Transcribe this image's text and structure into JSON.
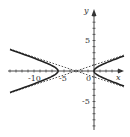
{
  "chart_data": {
    "type": "line",
    "title": "",
    "xlabel": "x",
    "ylabel": "y",
    "xlim": [
      -15,
      7
    ],
    "ylim": [
      -10,
      10
    ],
    "grid": false,
    "equation": "(x+3)^2/9 - y^2 = 1",
    "x_tick_labels": [
      "-10",
      "-5",
      "0"
    ],
    "y_tick_labels": [
      "5",
      "-5"
    ],
    "series": [
      {
        "name": "hyperbola-left-branch",
        "style": "solid",
        "points": [
          [
            -14,
            3.53
          ],
          [
            -10,
            2.07
          ],
          [
            -8,
            1.37
          ],
          [
            -7,
            0.88
          ],
          [
            -6,
            0
          ],
          [
            -7,
            -0.88
          ],
          [
            -8,
            -1.37
          ],
          [
            -10,
            -2.07
          ],
          [
            -14,
            -3.53
          ]
        ]
      },
      {
        "name": "hyperbola-right-branch",
        "style": "solid",
        "points": [
          [
            5,
            2.43
          ],
          [
            3,
            1.73
          ],
          [
            1,
            1.0
          ],
          [
            0.5,
            0.6
          ],
          [
            0,
            0
          ],
          [
            0.5,
            -0.6
          ],
          [
            1,
            -1.0
          ],
          [
            3,
            -1.73
          ],
          [
            5,
            -2.43
          ]
        ]
      },
      {
        "name": "asymptote-1",
        "style": "dashed",
        "points": [
          [
            -14,
            3.67
          ],
          [
            5,
            -2.67
          ]
        ]
      },
      {
        "name": "asymptote-2",
        "style": "dashed",
        "points": [
          [
            -14,
            -3.67
          ],
          [
            5,
            2.67
          ]
        ]
      }
    ]
  },
  "labels": {
    "x_axis": "x",
    "y_axis": "y",
    "origin": "0",
    "x_neg10": "-10",
    "x_neg5": "-5",
    "y_pos5": "5",
    "y_neg5": "-5"
  }
}
